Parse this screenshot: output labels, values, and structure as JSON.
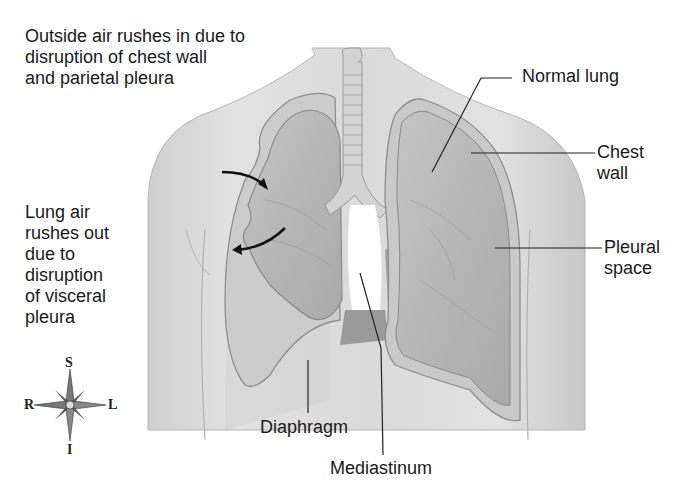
{
  "diagram": {
    "labels": {
      "outside_air": "Outside air rushes in due to\ndisruption of chest wall\nand parietal pleura",
      "lung_air": "Lung air\nrushes out\ndue to\ndisruption\nof visceral\npleura",
      "normal_lung": "Normal lung",
      "chest_wall": "Chest\nwall",
      "pleural_space": "Pleural\nspace",
      "diaphragm": "Diaphragm",
      "mediastinum": "Mediastinum"
    },
    "compass": {
      "superior": "S",
      "inferior": "I",
      "right": "R",
      "left": "L"
    },
    "colors": {
      "skin": "#d9d9d9",
      "skin_shadow": "#bdbdbd",
      "lung": "#b8b8b8",
      "lung_dark": "#9a9a9a",
      "outline": "#8a8a8a",
      "trachea": "#cfcfcf",
      "text": "#1a1a1a",
      "leader": "#222222"
    }
  }
}
